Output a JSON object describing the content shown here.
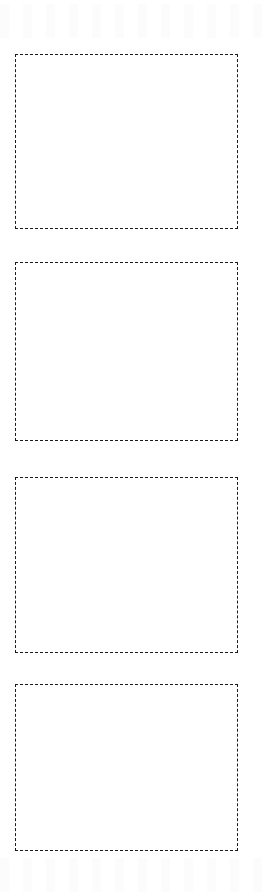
{
  "page": {
    "background_color": "#ffffff",
    "width": 263,
    "height": 895
  },
  "style": {
    "border_color": "#1a1a1a",
    "border_style": "dashed",
    "border_width_px": 1.5,
    "dash_length_px": 5,
    "dash_gap_px": 3,
    "box_fill_color": "#ffffff"
  },
  "placeholders": {
    "count": 4,
    "items": [
      {
        "index": "1",
        "content": "",
        "x": 15,
        "y": 54,
        "width": 223,
        "height": 175
      },
      {
        "index": "2",
        "content": "",
        "x": 15,
        "y": 262,
        "width": 223,
        "height": 179
      },
      {
        "index": "3",
        "content": "",
        "x": 15,
        "y": 477,
        "width": 223,
        "height": 176
      },
      {
        "index": "4",
        "content": "",
        "x": 15,
        "y": 684,
        "width": 223,
        "height": 167
      }
    ]
  }
}
